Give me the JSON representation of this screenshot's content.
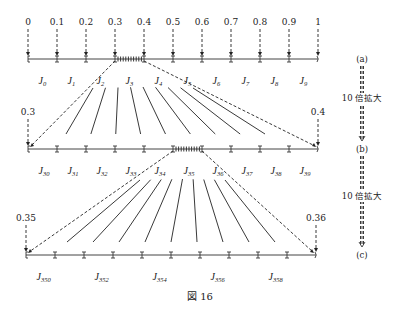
{
  "figure": {
    "caption": "図 16",
    "colors": {
      "ink": "#222222",
      "axis": "#444444",
      "background": "#ffffff"
    }
  },
  "rows": [
    {
      "id": "a",
      "side_label": "(a)",
      "y": 59,
      "x_start": 28,
      "x_end": 318,
      "top_labels": [
        "0",
        "0.1",
        "0.2",
        "0.3",
        "0.4",
        "0.5",
        "0.6",
        "0.7",
        "0.8",
        "0.9",
        "1"
      ],
      "top_label_indices": [
        0,
        1,
        2,
        3,
        4,
        5,
        6,
        7,
        8,
        9,
        10
      ],
      "interval_labels": [
        {
          "base": "J",
          "sub": "0"
        },
        {
          "base": "J",
          "sub": "1"
        },
        {
          "base": "J",
          "sub": "2"
        },
        {
          "base": "J",
          "sub": "3"
        },
        {
          "base": "J",
          "sub": "4"
        },
        {
          "base": "J",
          "sub": "5"
        },
        {
          "base": "J",
          "sub": "6"
        },
        {
          "base": "J",
          "sub": "7"
        },
        {
          "base": "J",
          "sub": "8"
        },
        {
          "base": "J",
          "sub": "9"
        }
      ],
      "label_every": 1,
      "highlight_interval": 3
    },
    {
      "id": "b",
      "side_label": "(b)",
      "y": 149,
      "x_start": 28,
      "x_end": 318,
      "top_labels": [
        "0.3",
        "0.4"
      ],
      "top_label_indices": [
        0,
        10
      ],
      "interval_labels": [
        {
          "base": "J",
          "sub": "30"
        },
        {
          "base": "J",
          "sub": "31"
        },
        {
          "base": "J",
          "sub": "32"
        },
        {
          "base": "J",
          "sub": "33"
        },
        {
          "base": "J",
          "sub": "34"
        },
        {
          "base": "J",
          "sub": "35"
        },
        {
          "base": "J",
          "sub": "36"
        },
        {
          "base": "J",
          "sub": "37"
        },
        {
          "base": "J",
          "sub": "38"
        },
        {
          "base": "J",
          "sub": "39"
        }
      ],
      "label_every": 1,
      "highlight_interval": 5
    },
    {
      "id": "c",
      "side_label": "(c)",
      "y": 255,
      "x_start": 26,
      "x_end": 316,
      "top_labels": [
        "0.35",
        "0.36"
      ],
      "top_label_indices": [
        0,
        10
      ],
      "interval_labels": [
        {
          "base": "J",
          "sub": "350"
        },
        {
          "base": "J",
          "sub": "352"
        },
        {
          "base": "J",
          "sub": "354"
        },
        {
          "base": "J",
          "sub": "356"
        },
        {
          "base": "J",
          "sub": "358"
        }
      ],
      "label_every": 2,
      "highlight_interval": -1
    }
  ],
  "zoom_steps": [
    {
      "label": "10 倍拡大",
      "from": "a",
      "to": "b"
    },
    {
      "label": "10 倍拡大",
      "from": "b",
      "to": "c"
    }
  ]
}
